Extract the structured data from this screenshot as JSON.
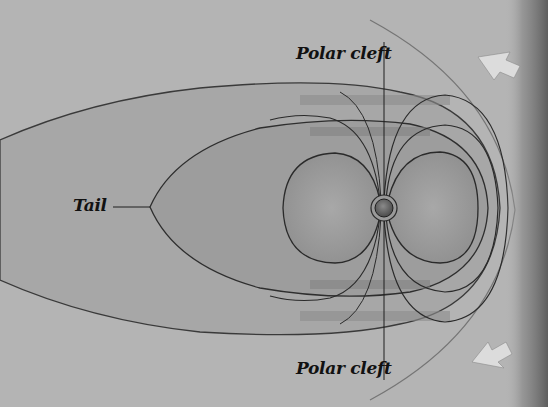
{
  "diagram": {
    "labels": {
      "polar_cleft_top": "Polar cleft",
      "polar_cleft_bottom": "Polar cleft",
      "tail": "Tail"
    },
    "elements": {
      "earth": "planet at center of field lines",
      "outer_magnetosphere": "outer teardrop shell extending to left",
      "inner_magnetosphere": "inner shell ending in tail point",
      "field_line_loops": "closed dipole field-line shells",
      "polar_axis": "vertical line through polar cleft",
      "solar_wind_arrows": "two arrows from right pointing toward Earth",
      "bow_shock": "curved boundary at right"
    },
    "colors": {
      "background": "#b4b4b4",
      "outer_shell": "#a6a6a6",
      "inner_shell": "#9c9c9c",
      "lines": "#2a2a2a",
      "arrow": "#d8d8d8",
      "right_shadow": "#6a6a6a"
    }
  }
}
